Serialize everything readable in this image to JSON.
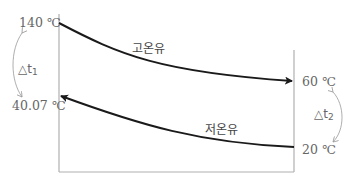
{
  "diagram": {
    "type": "temperature profile (heat exchanger, counter-flow)",
    "left_labels": {
      "top": "140 ℃",
      "bottom": "40.07 ℃",
      "delta": "△t",
      "delta_sub": "1"
    },
    "right_labels": {
      "top": "60 ℃",
      "bottom": "20 ℃",
      "delta": "△t",
      "delta_sub": "2"
    },
    "curves": [
      {
        "name": "고온유",
        "from": "140 ℃",
        "to": "60 ℃",
        "direction": "left-to-right"
      },
      {
        "name": "저온유",
        "from": "20 ℃",
        "to": "40.07 ℃",
        "direction": "right-to-left"
      }
    ],
    "colors": {
      "curve": "#1a1a1a",
      "axis": "#b0b0b0",
      "text": "#666666"
    }
  }
}
